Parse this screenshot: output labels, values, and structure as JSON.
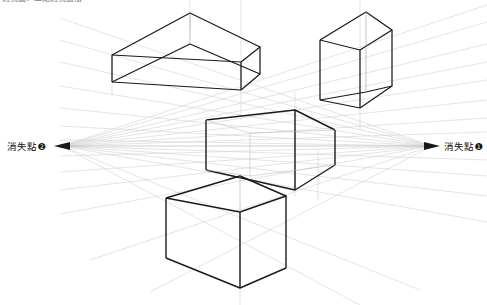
{
  "diagram": {
    "title_strip": "透視圖：二點透視畫法",
    "background_color": "#ffffff",
    "guide_line_color": "#c9c9c9",
    "faint_line_color": "#dcdcdc",
    "box_line_color": "#1a1a1a",
    "label_color": "#111111"
  },
  "vanishing_points": [
    {
      "id": "vp2",
      "label": "消失點❷",
      "side": "left",
      "x": 62,
      "y": 146,
      "label_x": 7,
      "label_y": 146
    },
    {
      "id": "vp1",
      "label": "消失點❶",
      "side": "right",
      "x": 432,
      "y": 146,
      "label_x": 444,
      "label_y": 146
    }
  ],
  "horizon": {
    "y": 146,
    "x_start": 62,
    "x_end": 432,
    "visible": true
  },
  "boxes": [
    {
      "name": "box-top-left",
      "description": "flat rectangular slab above horizon, seen from below",
      "front_vertical_x": 241,
      "top_y": 62,
      "bottom_y": 90
    },
    {
      "name": "box-top-right",
      "description": "tall upright box above horizon, seen from below",
      "front_vertical_x": 360,
      "top_y": 24,
      "bottom_y": 108
    },
    {
      "name": "box-center",
      "description": "box straddling the horizon line",
      "front_vertical_x": 295,
      "top_y": 110,
      "bottom_y": 175
    },
    {
      "name": "box-bottom",
      "description": "box below horizon, seen from above",
      "front_vertical_x": 240,
      "top_y": 192,
      "bottom_y": 288
    }
  ],
  "counts": {
    "boxes": 4,
    "vanishing_points": 2
  }
}
